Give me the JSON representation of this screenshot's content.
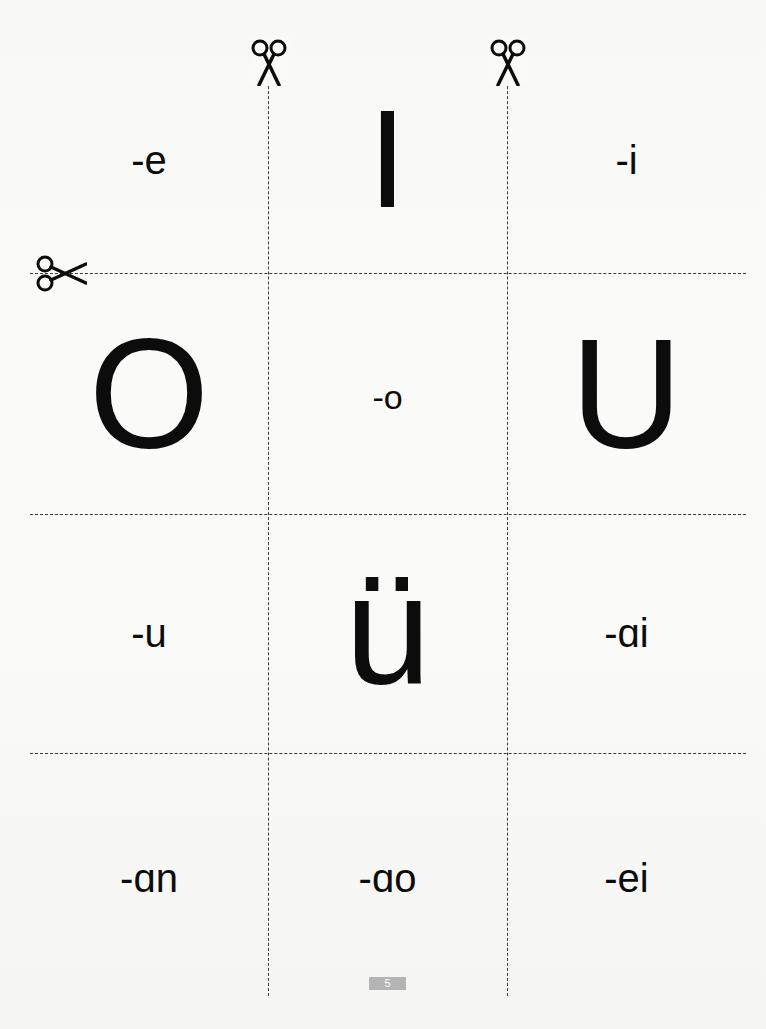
{
  "worksheet": {
    "cards": [
      {
        "row": 0,
        "col": 0,
        "text": "-e",
        "size": "small"
      },
      {
        "row": 0,
        "col": 1,
        "text": "I",
        "size": "big"
      },
      {
        "row": 0,
        "col": 2,
        "text": "-i",
        "size": "small"
      },
      {
        "row": 1,
        "col": 0,
        "text": "O",
        "size": "big"
      },
      {
        "row": 1,
        "col": 1,
        "text": "-o",
        "size": "small"
      },
      {
        "row": 1,
        "col": 2,
        "text": "U",
        "size": "big"
      },
      {
        "row": 2,
        "col": 0,
        "text": "-u",
        "size": "small"
      },
      {
        "row": 2,
        "col": 1,
        "text": "ü",
        "size": "big"
      },
      {
        "row": 2,
        "col": 2,
        "text": "-ɑi",
        "size": "small"
      },
      {
        "row": 3,
        "col": 0,
        "text": "-ɑn",
        "size": "small"
      },
      {
        "row": 3,
        "col": 1,
        "text": "-ɑo",
        "size": "small"
      },
      {
        "row": 3,
        "col": 2,
        "text": "-ei",
        "size": "small"
      }
    ],
    "cut_markers": [
      "scissors-icon",
      "scissors-icon",
      "scissors-icon"
    ],
    "page_number": "5"
  },
  "colors": {
    "ink": "#0c0c0c",
    "dash": "#3a3a3a",
    "page_number_bg": "#b4b4b4",
    "paper": "#f8f8f6"
  }
}
